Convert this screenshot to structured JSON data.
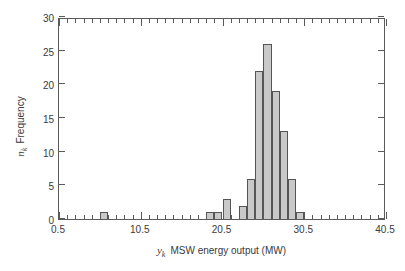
{
  "chart_data": {
    "type": "bar",
    "title": "",
    "subtitle": "",
    "xlabel_symbol": "y",
    "xlabel_subscript": "k",
    "xlabel_text": "MSW energy output  (MW)",
    "xlabel_full": "y_k  MSW energy output  (MW)",
    "ylabel_symbol": "n",
    "ylabel_subscript": "k",
    "ylabel_text": "Frequency",
    "ylabel_full": "n_k  Frequency",
    "xlim": [
      0.5,
      40.5
    ],
    "ylim": [
      0,
      30
    ],
    "xticks_major": [
      0.5,
      10.5,
      20.5,
      30.5,
      40.5
    ],
    "xtick_labels": [
      "0.5",
      "10.5",
      "20.5",
      "30.5",
      "40.5"
    ],
    "xtick_minor_interval": 1,
    "yticks": [
      0,
      5,
      10,
      15,
      20,
      25,
      30
    ],
    "ytick_labels": [
      "0",
      "5",
      "10",
      "15",
      "20",
      "25",
      "30"
    ],
    "grid": false,
    "legend": null,
    "bin_width": 1,
    "bar_fill_color": "#c9c9c9",
    "bar_edge_color": "#555555",
    "axis_color": "#5a5a5a",
    "bins": [
      {
        "left": 5.5,
        "right": 6.5,
        "center": 6.0,
        "value": 1
      },
      {
        "left": 18.5,
        "right": 19.5,
        "center": 19.0,
        "value": 1
      },
      {
        "left": 19.5,
        "right": 20.5,
        "center": 20.0,
        "value": 1
      },
      {
        "left": 20.5,
        "right": 21.5,
        "center": 21.0,
        "value": 3
      },
      {
        "left": 22.5,
        "right": 23.5,
        "center": 23.0,
        "value": 2
      },
      {
        "left": 23.5,
        "right": 24.5,
        "center": 24.0,
        "value": 6
      },
      {
        "left": 24.5,
        "right": 25.5,
        "center": 25.0,
        "value": 22
      },
      {
        "left": 25.5,
        "right": 26.5,
        "center": 26.0,
        "value": 26
      },
      {
        "left": 26.5,
        "right": 27.5,
        "center": 27.0,
        "value": 19
      },
      {
        "left": 27.5,
        "right": 28.5,
        "center": 28.0,
        "value": 13
      },
      {
        "left": 28.5,
        "right": 29.5,
        "center": 29.0,
        "value": 6
      },
      {
        "left": 29.5,
        "right": 30.5,
        "center": 30.0,
        "value": 1
      }
    ],
    "categories": [
      6.0,
      19.0,
      20.0,
      21.0,
      23.0,
      24.0,
      25.0,
      26.0,
      27.0,
      28.0,
      29.0,
      30.0
    ],
    "values": [
      1,
      1,
      1,
      3,
      2,
      6,
      22,
      26,
      19,
      13,
      6,
      1
    ]
  }
}
